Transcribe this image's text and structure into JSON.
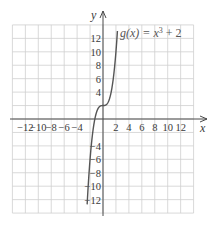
{
  "chart_data": {
    "type": "line",
    "title": "",
    "xlabel": "x",
    "ylabel": "y",
    "xlim": [
      -14,
      14
    ],
    "ylim": [
      -14,
      14
    ],
    "grid": true,
    "grid_step": 2,
    "x_ticks": [
      -12,
      -10,
      -8,
      -6,
      -4,
      2,
      4,
      6,
      8,
      10,
      12
    ],
    "x_tick_labels": [
      "−12",
      "−10",
      "−8",
      "−6",
      "−4",
      "2",
      "4",
      "6",
      "8",
      "10",
      "12"
    ],
    "y_ticks": [
      12,
      10,
      8,
      6,
      4,
      -4,
      -6,
      -8,
      -10,
      -12
    ],
    "y_tick_labels": [
      "12",
      "10",
      "8",
      "6",
      "4",
      "−4",
      "−6",
      "−8",
      "−10",
      "−12"
    ],
    "series": [
      {
        "name": "g(x) = x³ + 2",
        "function": "x^3 + 2",
        "x": [
          -2.4,
          -2.2,
          -2.0,
          -1.6,
          -1.2,
          -0.8,
          -0.4,
          0,
          0.4,
          0.8,
          1.2,
          1.6,
          2.0,
          2.2
        ],
        "y": [
          -11.82,
          -8.65,
          -6.0,
          -2.1,
          0.27,
          1.49,
          1.94,
          2.0,
          2.06,
          2.51,
          3.73,
          6.1,
          10.0,
          12.65
        ],
        "color": "#555555"
      }
    ],
    "annotations": [
      {
        "text": "g(x) = x³ + 2",
        "x": 2.3,
        "y": 13
      }
    ],
    "legend": "none"
  },
  "labels": {
    "x_axis": "x",
    "y_axis": "y",
    "function_name": "g(x) = x",
    "function_exp": "3",
    "function_tail": " + 2"
  },
  "colors": {
    "grid": "#cfcfcf",
    "axis": "#4a4a4a",
    "curve": "#555555",
    "text": "#3a3a3a"
  }
}
